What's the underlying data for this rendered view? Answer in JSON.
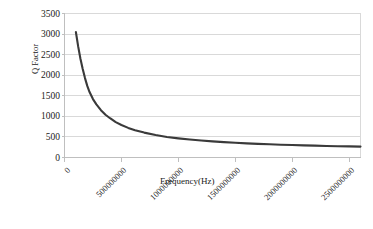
{
  "chart_data": {
    "type": "line",
    "title": "",
    "xlabel": "Frequency(Hz)",
    "ylabel": "Q Factor",
    "xlim": [
      0,
      2600000000
    ],
    "ylim": [
      0,
      3500
    ],
    "grid": true,
    "legend": false,
    "x_tick_labels": [
      "0",
      "500000000",
      "1000000000",
      "1500000000",
      "2000000000",
      "2500000000"
    ],
    "x_tick_values": [
      0,
      500000000,
      1000000000,
      1500000000,
      2000000000,
      2500000000
    ],
    "y_tick_labels": [
      "0",
      "500",
      "1000",
      "1500",
      "2000",
      "2500",
      "3000",
      "3500"
    ],
    "y_tick_values": [
      0,
      500,
      1000,
      1500,
      2000,
      2500,
      3000,
      3500
    ],
    "series": [
      {
        "name": "Q Factor",
        "color": "#3a3a3a",
        "x": [
          100000000,
          120000000,
          140000000,
          160000000,
          180000000,
          200000000,
          220000000,
          250000000,
          280000000,
          320000000,
          360000000,
          400000000,
          450000000,
          500000000,
          560000000,
          620000000,
          700000000,
          800000000,
          900000000,
          1000000000,
          1100000000,
          1200000000,
          1300000000,
          1400000000,
          1500000000,
          1600000000,
          1700000000,
          1800000000,
          1900000000,
          2000000000,
          2100000000,
          2200000000,
          2300000000,
          2400000000,
          2500000000,
          2600000000
        ],
        "y": [
          3050,
          2700,
          2400,
          2150,
          1930,
          1740,
          1590,
          1420,
          1290,
          1150,
          1040,
          955,
          860,
          790,
          720,
          665,
          605,
          545,
          500,
          465,
          436,
          412,
          391,
          373,
          357,
          344,
          332,
          321,
          311,
          303,
          295,
          288,
          281,
          275,
          270,
          265
        ]
      }
    ]
  },
  "style": {
    "line_color": "#3a3a3a",
    "grid_color": "#d9d9d9",
    "axis_color": "#bfbfbf",
    "plot_bg": "#ffffff",
    "text_color": "#1a1a1a"
  }
}
